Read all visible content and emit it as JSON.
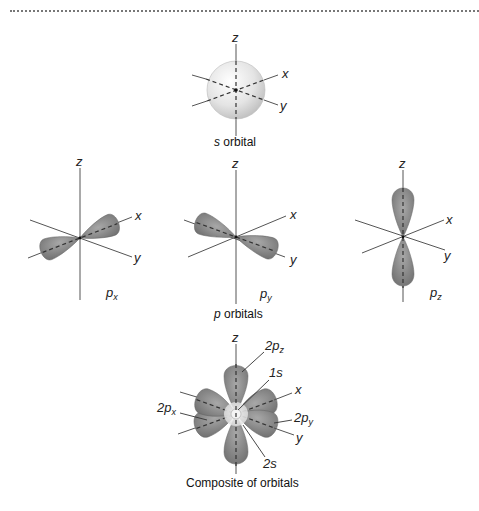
{
  "figure": {
    "s_panel": {
      "axes": {
        "z": "z",
        "x": "x",
        "y": "y"
      },
      "caption_italic": "s",
      "caption_rest": " orbital"
    },
    "p_panels": {
      "px": {
        "axes": {
          "z": "z",
          "x": "x",
          "y": "y"
        },
        "label_main": "p",
        "label_sub": "x"
      },
      "py": {
        "axes": {
          "z": "z",
          "x": "x",
          "y": "y"
        },
        "label_main": "p",
        "label_sub": "y"
      },
      "pz": {
        "axes": {
          "z": "z",
          "x": "x",
          "y": "y"
        },
        "label_main": "p",
        "label_sub": "z"
      },
      "caption_italic": "p",
      "caption_rest": " orbitals"
    },
    "composite_panel": {
      "axes": {
        "z": "z",
        "x": "x",
        "y": "y"
      },
      "labels": {
        "2pz_main": "2p",
        "2pz_sub": "z",
        "1s": "1s",
        "2py_main": "2p",
        "2py_sub": "y",
        "2px_main": "2p",
        "2px_sub": "x",
        "2s": "2s"
      },
      "caption": "Composite of orbitals"
    },
    "colors": {
      "lobe": "#8a8a8a",
      "lobe_light": "#b5b5b5",
      "sphere": "#e6e6e6",
      "axis": "#555555"
    }
  }
}
